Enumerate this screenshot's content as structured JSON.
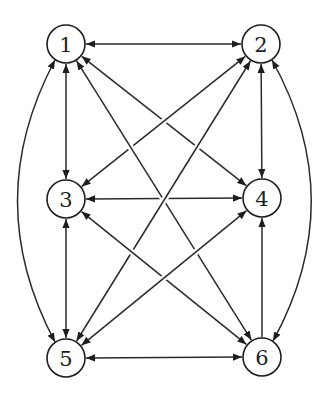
{
  "diagram": {
    "type": "directed-graph",
    "colors": {
      "stroke": "#2a2a2a",
      "node_fill": "#ffffff",
      "background": "#ffffff"
    },
    "nodes": [
      {
        "id": "1",
        "label": "1"
      },
      {
        "id": "2",
        "label": "2"
      },
      {
        "id": "3",
        "label": "3"
      },
      {
        "id": "4",
        "label": "4"
      },
      {
        "id": "5",
        "label": "5"
      },
      {
        "id": "6",
        "label": "6"
      }
    ],
    "edges": [
      {
        "from": "1",
        "to": "2",
        "bidirectional": true,
        "shape": "straight"
      },
      {
        "from": "1",
        "to": "3",
        "bidirectional": true,
        "shape": "straight"
      },
      {
        "from": "2",
        "to": "4",
        "bidirectional": true,
        "shape": "straight"
      },
      {
        "from": "3",
        "to": "4",
        "bidirectional": true,
        "shape": "straight"
      },
      {
        "from": "3",
        "to": "5",
        "bidirectional": true,
        "shape": "straight"
      },
      {
        "from": "5",
        "to": "6",
        "bidirectional": true,
        "shape": "straight"
      },
      {
        "from": "6",
        "to": "4",
        "bidirectional": false,
        "shape": "straight"
      },
      {
        "from": "1",
        "to": "5",
        "bidirectional": true,
        "shape": "arc-left"
      },
      {
        "from": "2",
        "to": "6",
        "bidirectional": true,
        "shape": "arc-right"
      },
      {
        "from": "1",
        "to": "4",
        "bidirectional": true,
        "shape": "straight"
      },
      {
        "from": "2",
        "to": "3",
        "bidirectional": true,
        "shape": "straight"
      },
      {
        "from": "1",
        "to": "6",
        "bidirectional": true,
        "shape": "straight"
      },
      {
        "from": "2",
        "to": "5",
        "bidirectional": true,
        "shape": "straight"
      },
      {
        "from": "3",
        "to": "6",
        "bidirectional": true,
        "shape": "straight"
      },
      {
        "from": "4",
        "to": "5",
        "bidirectional": true,
        "shape": "straight"
      }
    ]
  }
}
